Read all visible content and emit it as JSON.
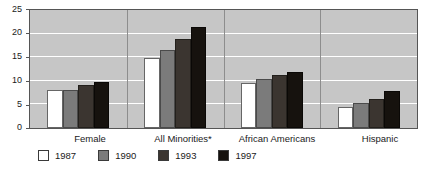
{
  "chart_data": {
    "type": "bar",
    "title": "",
    "subtitle": "",
    "xlabel": "",
    "ylabel": "",
    "ylim": [
      0,
      25
    ],
    "yticks": [
      0,
      5,
      10,
      15,
      20,
      25
    ],
    "grid": true,
    "legend_position": "bottom-left",
    "categories": [
      "Female",
      "All Minorities*",
      "African Americans",
      "Hispanic"
    ],
    "series": [
      {
        "name": "1987",
        "color": "#ffffff",
        "values": [
          8.0,
          14.8,
          9.5,
          4.5
        ]
      },
      {
        "name": "1990",
        "color": "#7b7b7b",
        "values": [
          8.0,
          16.5,
          10.3,
          5.2
        ]
      },
      {
        "name": "1993",
        "color": "#3b3530",
        "values": [
          9.1,
          18.8,
          11.3,
          6.2
        ]
      },
      {
        "name": "1997",
        "color": "#16120e",
        "values": [
          9.8,
          21.5,
          11.8,
          7.8
        ]
      }
    ]
  },
  "axis": {
    "y_tick_labels": [
      "25",
      "20",
      "15",
      "10",
      "5",
      "0"
    ]
  },
  "categories": {
    "c0": "Female",
    "c1": "All Minorities*",
    "c2": "African Americans",
    "c3": "Hispanic"
  },
  "legend": {
    "items": [
      {
        "label": "1987"
      },
      {
        "label": "1990"
      },
      {
        "label": "1993"
      },
      {
        "label": "1997"
      }
    ]
  },
  "colors": {
    "plot_background": "#c6c6c6",
    "gridline": "#ffffff",
    "axis": "#555555",
    "text": "#1a1a1a",
    "series_1987": "#ffffff",
    "series_1990": "#7b7b7b",
    "series_1993": "#3b3530",
    "series_1997": "#16120e"
  }
}
